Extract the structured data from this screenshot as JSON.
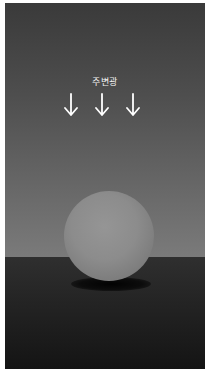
{
  "diagram": {
    "title_label": "주변광",
    "arrows": [
      {
        "direction": "down",
        "icon": "arrow-down-icon"
      },
      {
        "direction": "down",
        "icon": "arrow-down-icon"
      },
      {
        "direction": "down",
        "icon": "arrow-down-icon"
      }
    ],
    "objects": [
      {
        "type": "sphere",
        "color": "#8a8a8a"
      },
      {
        "type": "floor",
        "color": "#2a2a2a"
      },
      {
        "type": "shadow",
        "color": "#000000"
      }
    ],
    "colors": {
      "background_top": "#3a3a3a",
      "background_horizon": "#7a7a7a",
      "floor_top": "#2f2f2f",
      "floor_bottom": "#141414",
      "arrow": "#ffffff",
      "label": "#f2f2f2"
    }
  }
}
